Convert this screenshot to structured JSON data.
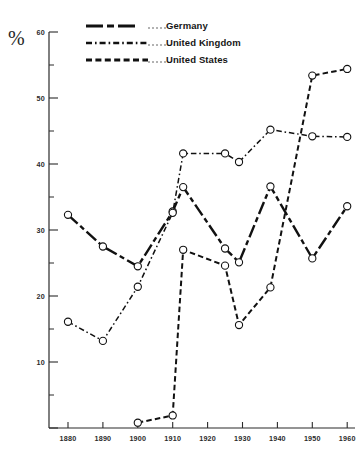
{
  "chart_data": {
    "type": "line",
    "title": "",
    "xlabel": "",
    "ylabel": "%",
    "xlim": [
      1875,
      1963
    ],
    "ylim": [
      0,
      60
    ],
    "yticks": [
      0,
      10,
      20,
      30,
      40,
      50,
      60
    ],
    "ytick_labels": [
      "",
      "10",
      "20",
      "30",
      "40",
      "50",
      "60"
    ],
    "yminor_step": 5,
    "xticks": [
      1880,
      1890,
      1900,
      1910,
      1920,
      1930,
      1940,
      1950,
      1960
    ],
    "xtick_labels": [
      "1880",
      "1890",
      "1900",
      "1910",
      "1920",
      "1930",
      "1940",
      "1950",
      "1960"
    ],
    "grid": false,
    "legend_position": "top-center",
    "markers": "open-circle",
    "series": [
      {
        "name": "Germany",
        "style": "dash-dot-long",
        "line_width": 2.4,
        "x": [
          1880,
          1890,
          1900,
          1910,
          1913,
          1925,
          1929,
          1938,
          1950,
          1960
        ],
        "y": [
          32.3,
          27.5,
          24.5,
          32.8,
          36.5,
          27.2,
          25.1,
          36.6,
          25.7,
          33.6
        ]
      },
      {
        "name": "United Kingdom",
        "style": "dash-dot-short",
        "line_width": 1.5,
        "x": [
          1880,
          1890,
          1900,
          1910,
          1913,
          1925,
          1929,
          1938,
          1950,
          1960
        ],
        "y": [
          16.1,
          13.2,
          21.4,
          32.6,
          41.6,
          41.6,
          40.3,
          45.2,
          44.2,
          44.1
        ]
      },
      {
        "name": "United States",
        "style": "dashed",
        "line_width": 2.0,
        "x": [
          1900,
          1910,
          1913,
          1925,
          1929,
          1938,
          1950,
          1960
        ],
        "y": [
          0.8,
          1.9,
          27.0,
          24.6,
          15.6,
          21.3,
          53.4,
          54.4
        ]
      }
    ]
  },
  "legend": {
    "items": [
      {
        "label": "Germany",
        "style": "dash-dot-long"
      },
      {
        "label": "United Kingdom",
        "style": "dash-dot-short"
      },
      {
        "label": "United States",
        "style": "dashed"
      }
    ]
  },
  "axis": {
    "y_unit_label": "%"
  }
}
